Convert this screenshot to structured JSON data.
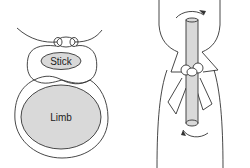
{
  "diagram": {
    "left_panel": {
      "description": "cross-section of tourniquet with stick over limb",
      "labels": {
        "stick": "Stick",
        "limb": "Limb"
      }
    },
    "right_panel": {
      "description": "side view of stick tied to limb with twisting arrows"
    },
    "colors": {
      "line": "#333333",
      "fill": "#d9d9d9",
      "background": "#ffffff"
    }
  }
}
